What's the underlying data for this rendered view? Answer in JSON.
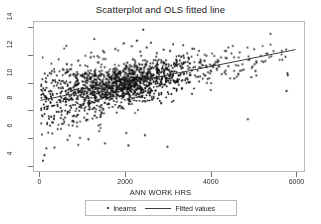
{
  "chart_data": {
    "type": "scatter",
    "title": "Scatterplot and OLS fitted line",
    "xlabel": "ANN WORK HRS",
    "ylabel": "",
    "xlim": [
      -150,
      6200
    ],
    "ylim": [
      3.6,
      14.4
    ],
    "xticks": [
      0,
      2000,
      4000,
      6000
    ],
    "xtick_labels": [
      "0",
      "2000",
      "4000",
      "6000"
    ],
    "yticks": [
      4,
      6,
      8,
      10,
      12,
      14
    ],
    "ytick_labels": [
      "4",
      "6",
      "8",
      "10",
      "12",
      "14"
    ],
    "grid": false,
    "legend_position": "below-axis",
    "legend": [
      {
        "label": "lnearns",
        "marker": "dot",
        "color": "#111111"
      },
      {
        "label": "Fitted values",
        "marker": "line",
        "color": "#3b3b3b"
      }
    ],
    "series": [
      {
        "name": "lnearns",
        "type": "scatter",
        "marker": "dot",
        "color": "#111111",
        "n_points": 1600,
        "description": "Log annual earnings versus annual work hours; dense cloud centered near 2000-2800 hours at lnearns 9.5-11 with a long low tail at few hours.",
        "cloud": {
          "x_mean": 2050,
          "x_sd": 780,
          "x_min": 20,
          "x_max": 5900,
          "intercept": 8.7,
          "slope": 0.00062,
          "resid_sd": 0.72,
          "resid_sd_low_hours": 1.25,
          "y_min": 4.3,
          "y_max": 13.9
        },
        "outliers": [
          [
            2420,
            13.85
          ],
          [
            2270,
            13.05
          ],
          [
            2600,
            12.9
          ],
          [
            1960,
            12.85
          ],
          [
            2150,
            12.65
          ],
          [
            2500,
            12.55
          ],
          [
            1760,
            12.45
          ],
          [
            2900,
            12.4
          ],
          [
            3050,
            12.3
          ],
          [
            2350,
            12.25
          ],
          [
            1500,
            12.2
          ],
          [
            2740,
            12.15
          ],
          [
            3260,
            11.95
          ],
          [
            1180,
            11.85
          ],
          [
            3480,
            11.8
          ],
          [
            890,
            11.6
          ],
          [
            4120,
            11.5
          ],
          [
            3760,
            11.45
          ],
          [
            620,
            11.35
          ],
          [
            4420,
            11.2
          ],
          [
            4780,
            10.95
          ],
          [
            5060,
            10.85
          ],
          [
            5810,
            10.7
          ],
          [
            5820,
            10.55
          ],
          [
            4960,
            10.4
          ],
          [
            4560,
            10.3
          ],
          [
            5790,
            9.4
          ],
          [
            4880,
            7.35
          ],
          [
            2990,
            5.35
          ],
          [
            2070,
            5.45
          ],
          [
            1520,
            5.6
          ],
          [
            1130,
            5.9
          ],
          [
            930,
            6.0
          ],
          [
            640,
            5.85
          ],
          [
            330,
            5.3
          ],
          [
            140,
            5.25
          ],
          [
            95,
            4.75
          ],
          [
            60,
            4.35
          ],
          [
            2020,
            6.35
          ],
          [
            2460,
            6.2
          ]
        ]
      },
      {
        "name": "Fitted values",
        "type": "line",
        "color": "#3b3b3b",
        "intercept": 8.72,
        "slope": 0.000613,
        "x_start": 0,
        "y_start": 8.72,
        "x_end": 6000,
        "y_end": 12.4
      }
    ]
  },
  "figure": {
    "title": "Scatterplot and OLS fitted line",
    "xaxis_title": "ANN WORK HRS"
  }
}
